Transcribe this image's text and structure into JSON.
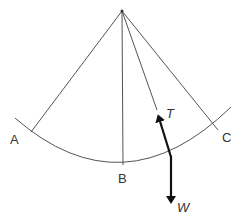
{
  "diagram": {
    "type": "pendulum-forces",
    "points": {
      "A": {
        "label": "A"
      },
      "B": {
        "label": "B"
      },
      "C": {
        "label": "C"
      }
    },
    "forces": {
      "tension": {
        "label": "T"
      },
      "weight": {
        "label": "W"
      }
    },
    "colors": {
      "line": "#555555",
      "arrow": "#111111",
      "text": "#333333"
    }
  }
}
